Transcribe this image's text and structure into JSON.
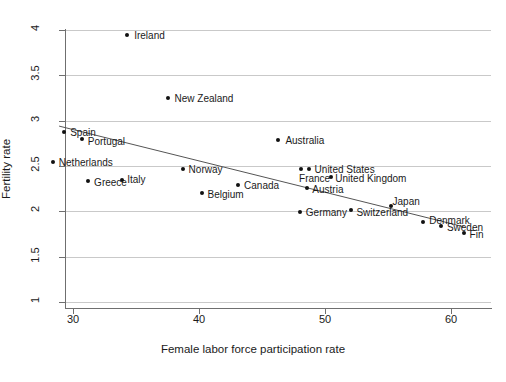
{
  "chart_data": {
    "type": "scatter",
    "title": "",
    "xlabel": "Female labor force participation rate",
    "ylabel": "Fertility rate",
    "xlim": [
      27.0,
      62.5
    ],
    "ylim": [
      1.0,
      4.1
    ],
    "xticks": [
      30,
      40,
      50,
      60
    ],
    "xtick_labels": [
      "30",
      "40",
      "50",
      "60"
    ],
    "yticks": [
      1,
      1.5,
      2,
      2.5,
      3,
      3.5,
      4
    ],
    "ytick_labels": [
      "1",
      "1.5",
      "2",
      "2.5",
      "3",
      "3.5",
      "4"
    ],
    "grid": true,
    "grid_axis": "y",
    "legend": "none",
    "marker_color": "#111111",
    "fit_line": {
      "type": "linear-fit",
      "color": "#555555",
      "x_start": 28.9,
      "y_start": 2.94,
      "x_end": 61.0,
      "y_end": 1.83
    },
    "points": [
      {
        "label": "Ireland",
        "x": 34.3,
        "y": 3.94,
        "label_dx": 7,
        "label_dy": 0
      },
      {
        "label": "New Zealand",
        "x": 37.5,
        "y": 3.25,
        "label_dx": 7,
        "label_dy": 0
      },
      {
        "label": "Australia",
        "x": 46.3,
        "y": 2.79,
        "label_dx": 7,
        "label_dy": 0
      },
      {
        "label": "Spain",
        "x": 29.3,
        "y": 2.88,
        "label_dx": 6,
        "label_dy": 0
      },
      {
        "label": "Portugal",
        "x": 30.7,
        "y": 2.8,
        "label_dx": 6,
        "label_dy": 2
      },
      {
        "label": "Netherlands",
        "x": 28.4,
        "y": 2.54,
        "label_dx": 6,
        "label_dy": 0
      },
      {
        "label": "Greece",
        "x": 31.2,
        "y": 2.34,
        "label_dx": 6,
        "label_dy": 1
      },
      {
        "label": "Italy",
        "x": 33.9,
        "y": 2.35,
        "label_dx": 5,
        "label_dy": -1
      },
      {
        "label": "Norway",
        "x": 38.7,
        "y": 2.47,
        "label_dx": 6,
        "label_dy": 0
      },
      {
        "label": "Belgium",
        "x": 40.2,
        "y": 2.2,
        "label_dx": 6,
        "label_dy": 1
      },
      {
        "label": "Canada",
        "x": 43.1,
        "y": 2.29,
        "label_dx": 6,
        "label_dy": 0
      },
      {
        "label": "France",
        "x": 48.1,
        "y": 2.47,
        "label_dx": -2,
        "label_dy": 9
      },
      {
        "label": "United States",
        "x": 48.7,
        "y": 2.47,
        "label_dx": 6,
        "label_dy": 0
      },
      {
        "label": "United Kingdom",
        "x": 50.5,
        "y": 2.38,
        "label_dx": 4,
        "label_dy": 1
      },
      {
        "label": "Austria",
        "x": 48.6,
        "y": 2.26,
        "label_dx": 5,
        "label_dy": 1
      },
      {
        "label": "Germany",
        "x": 48.0,
        "y": 1.99,
        "label_dx": 6,
        "label_dy": 0
      },
      {
        "label": "Switzerland",
        "x": 52.1,
        "y": 2.01,
        "label_dx": 5,
        "label_dy": 2
      },
      {
        "label": "Japan",
        "x": 55.2,
        "y": 2.06,
        "label_dx": 2,
        "label_dy": -5
      },
      {
        "label": "Denmark",
        "x": 57.8,
        "y": 1.88,
        "label_dx": 6,
        "label_dy": -2
      },
      {
        "label": "Sweden",
        "x": 59.2,
        "y": 1.84,
        "label_dx": 6,
        "label_dy": 1
      },
      {
        "label": "Fin",
        "x": 61.0,
        "y": 1.76,
        "label_dx": 6,
        "label_dy": 1
      }
    ]
  }
}
